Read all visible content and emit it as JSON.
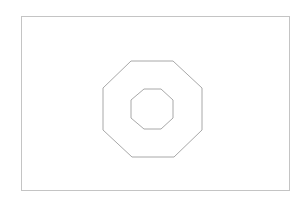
{
  "canvas": {
    "width": 308,
    "height": 200,
    "background": "#ffffff"
  },
  "frame": {
    "x": 21.5,
    "y": 16.5,
    "width": 268,
    "height": 174,
    "stroke": "#c4c4c4"
  },
  "shapes": [
    {
      "name": "outer-octagon",
      "stroke": "#a8a8a8",
      "points": "131,61 173,61 202,88 202,130 174,157 132,157 103,130 103,88"
    },
    {
      "name": "inner-octagon",
      "stroke": "#a8a8a8",
      "points": "144,89 161,89 173,100 173,118 161,129 144,129 131,118 131,100"
    }
  ]
}
